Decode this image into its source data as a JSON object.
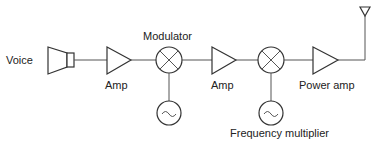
{
  "diagram": {
    "type": "block-diagram",
    "labels": {
      "voice": "Voice",
      "amp1": "Amp",
      "modulator": "Modulator",
      "amp2": "Amp",
      "power_amp": "Power amp",
      "frequency_multiplier": "Frequency multiplier"
    },
    "nodes": [
      {
        "id": "voice",
        "shape": "speaker",
        "label": "Voice"
      },
      {
        "id": "amp1",
        "shape": "triangle",
        "label": "Amp"
      },
      {
        "id": "modulator",
        "shape": "mixer",
        "label": "Modulator"
      },
      {
        "id": "osc1",
        "shape": "oscillator",
        "label": ""
      },
      {
        "id": "amp2",
        "shape": "triangle",
        "label": "Amp"
      },
      {
        "id": "mixer2",
        "shape": "mixer",
        "label": ""
      },
      {
        "id": "osc2",
        "shape": "oscillator",
        "label": "Frequency multiplier"
      },
      {
        "id": "power_amp",
        "shape": "triangle",
        "label": "Power amp"
      },
      {
        "id": "antenna",
        "shape": "antenna",
        "label": ""
      }
    ],
    "edges": [
      [
        "voice",
        "amp1"
      ],
      [
        "amp1",
        "modulator"
      ],
      [
        "osc1",
        "modulator"
      ],
      [
        "modulator",
        "amp2"
      ],
      [
        "amp2",
        "mixer2"
      ],
      [
        "osc2",
        "mixer2"
      ],
      [
        "mixer2",
        "power_amp"
      ],
      [
        "power_amp",
        "antenna"
      ]
    ]
  }
}
